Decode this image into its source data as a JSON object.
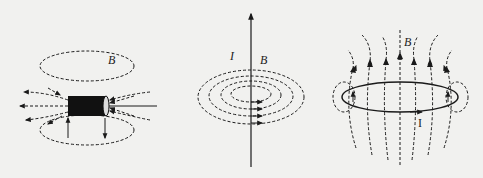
{
  "figure": {
    "panels": [
      {
        "id": "solenoid",
        "description": "Short solenoid (coil) with magnetic field lines looping around it",
        "labels": {
          "field": "B"
        }
      },
      {
        "id": "straight-wire",
        "description": "Straight current-carrying wire with concentric circular field lines",
        "labels": {
          "current": "I",
          "field": "B"
        }
      },
      {
        "id": "current-loop",
        "description": "Circular current loop with field lines passing through it",
        "labels": {
          "field": "B",
          "current": "I"
        }
      }
    ]
  },
  "colors": {
    "background": "#f1f1ef",
    "ink": "#1a1a1a"
  }
}
